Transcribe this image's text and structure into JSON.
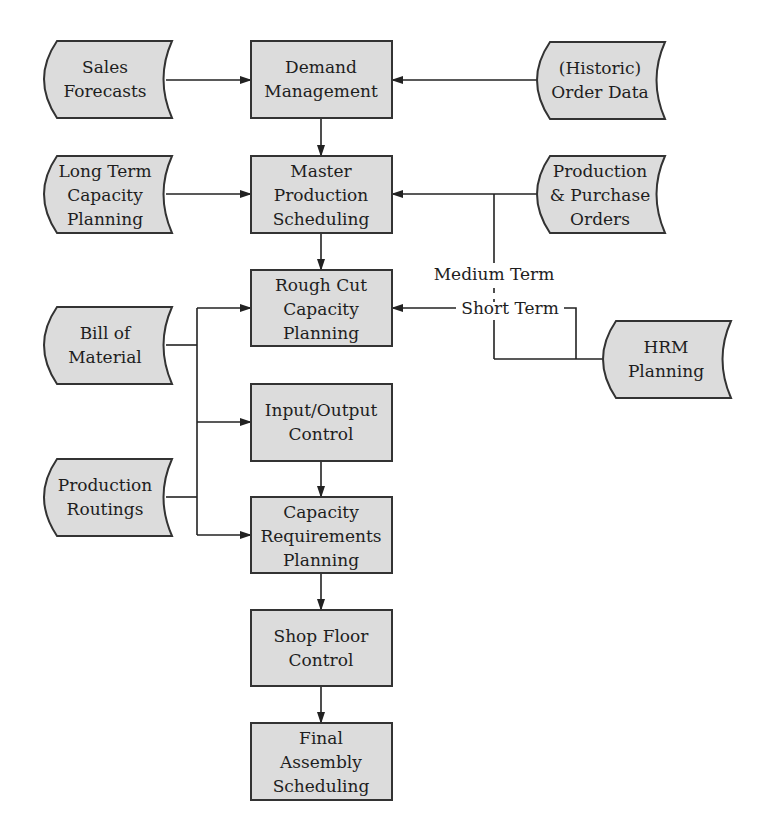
{
  "diagram": {
    "type": "flowchart",
    "colors": {
      "fill": "#dcdcdc",
      "stroke": "#333333",
      "text": "#1e1e1e",
      "background": "#ffffff"
    },
    "data_sources": [
      {
        "id": "sales_forecasts",
        "lines": [
          "Sales",
          "Forecasts"
        ]
      },
      {
        "id": "long_term_capacity_planning",
        "lines": [
          "Long Term",
          "Capacity",
          "Planning"
        ]
      },
      {
        "id": "bill_of_material",
        "lines": [
          "Bill of",
          "Material"
        ]
      },
      {
        "id": "production_routings",
        "lines": [
          "Production",
          "Routings"
        ]
      },
      {
        "id": "historic_order_data",
        "lines": [
          "(Historic)",
          "Order Data"
        ]
      },
      {
        "id": "production_purchase_orders",
        "lines": [
          "Production",
          "& Purchase",
          "Orders"
        ]
      },
      {
        "id": "hrm_planning",
        "lines": [
          "HRM",
          "Planning"
        ]
      }
    ],
    "processes": [
      {
        "id": "demand_management",
        "lines": [
          "Demand",
          "Management"
        ]
      },
      {
        "id": "master_production_scheduling",
        "lines": [
          "Master",
          "Production",
          "Scheduling"
        ]
      },
      {
        "id": "rough_cut_capacity_planning",
        "lines": [
          "Rough Cut",
          "Capacity",
          "Planning"
        ]
      },
      {
        "id": "input_output_control",
        "lines": [
          "Input/Output",
          "Control"
        ]
      },
      {
        "id": "capacity_requirements_planning",
        "lines": [
          "Capacity",
          "Requirements",
          "Planning"
        ]
      },
      {
        "id": "shop_floor_control",
        "lines": [
          "Shop Floor",
          "Control"
        ]
      },
      {
        "id": "final_assembly_scheduling",
        "lines": [
          "Final",
          "Assembly",
          "Scheduling"
        ]
      }
    ],
    "edge_labels": {
      "medium_term": "Medium Term",
      "short_term": "Short Term"
    },
    "edges": [
      {
        "from": "sales_forecasts",
        "to": "demand_management"
      },
      {
        "from": "historic_order_data",
        "to": "demand_management"
      },
      {
        "from": "demand_management",
        "to": "master_production_scheduling"
      },
      {
        "from": "long_term_capacity_planning",
        "to": "master_production_scheduling"
      },
      {
        "from": "production_purchase_orders",
        "to": "master_production_scheduling"
      },
      {
        "from": "hrm_planning",
        "to": "master_production_scheduling",
        "label": "Medium Term"
      },
      {
        "from": "master_production_scheduling",
        "to": "rough_cut_capacity_planning"
      },
      {
        "from": "hrm_planning",
        "to": "rough_cut_capacity_planning",
        "label": "Short Term"
      },
      {
        "from": "production_purchase_orders",
        "to": "rough_cut_capacity_planning",
        "style": "dashed"
      },
      {
        "from": "bill_of_material",
        "to": "rough_cut_capacity_planning"
      },
      {
        "from": "bill_of_material",
        "to": "input_output_control"
      },
      {
        "from": "bill_of_material",
        "to": "capacity_requirements_planning"
      },
      {
        "from": "production_routings",
        "to": "rough_cut_capacity_planning"
      },
      {
        "from": "production_routings",
        "to": "input_output_control"
      },
      {
        "from": "production_routings",
        "to": "capacity_requirements_planning"
      },
      {
        "from": "input_output_control",
        "to": "capacity_requirements_planning"
      },
      {
        "from": "capacity_requirements_planning",
        "to": "shop_floor_control"
      },
      {
        "from": "shop_floor_control",
        "to": "final_assembly_scheduling"
      }
    ]
  }
}
